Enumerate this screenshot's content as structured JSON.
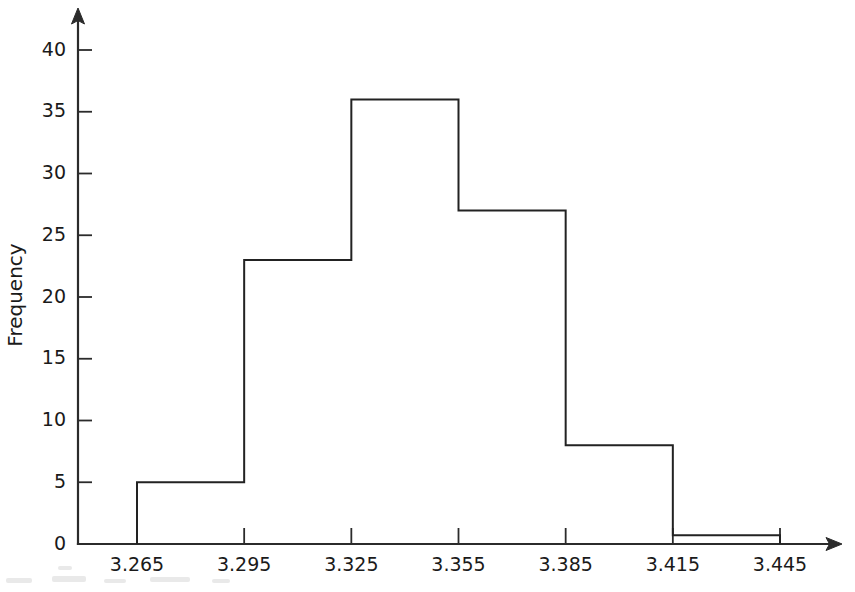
{
  "chart_data": {
    "type": "bar",
    "title": "",
    "subtitle": "",
    "xlabel": "",
    "ylabel": "Frequency",
    "grid": false,
    "legend": false,
    "legend_position": "none",
    "bin_width": 0.03,
    "bin_edges": [
      3.265,
      3.295,
      3.325,
      3.355,
      3.385,
      3.415,
      3.445
    ],
    "categories": [
      "3.265-3.295",
      "3.295-3.325",
      "3.325-3.355",
      "3.355-3.385",
      "3.385-3.415",
      "3.415-3.445"
    ],
    "values": [
      5,
      23,
      36,
      27,
      8,
      0.7
    ],
    "xlim": [
      3.265,
      3.445
    ],
    "ylim": [
      0,
      42
    ],
    "xticks": [
      "3.265",
      "3.295",
      "3.325",
      "3.355",
      "3.385",
      "3.415",
      "3.445"
    ],
    "xtick_values": [
      3.265,
      3.295,
      3.325,
      3.355,
      3.385,
      3.415,
      3.445
    ],
    "yticks": [
      "0",
      "5",
      "10",
      "15",
      "20",
      "25",
      "30",
      "35",
      "40"
    ],
    "ytick_values": [
      0,
      5,
      10,
      15,
      20,
      25,
      30,
      35,
      40
    ],
    "bar_fill": "#ffffff",
    "bar_stroke": "#222222",
    "axis_color": "#2b2b2b",
    "background": "#ffffff"
  }
}
